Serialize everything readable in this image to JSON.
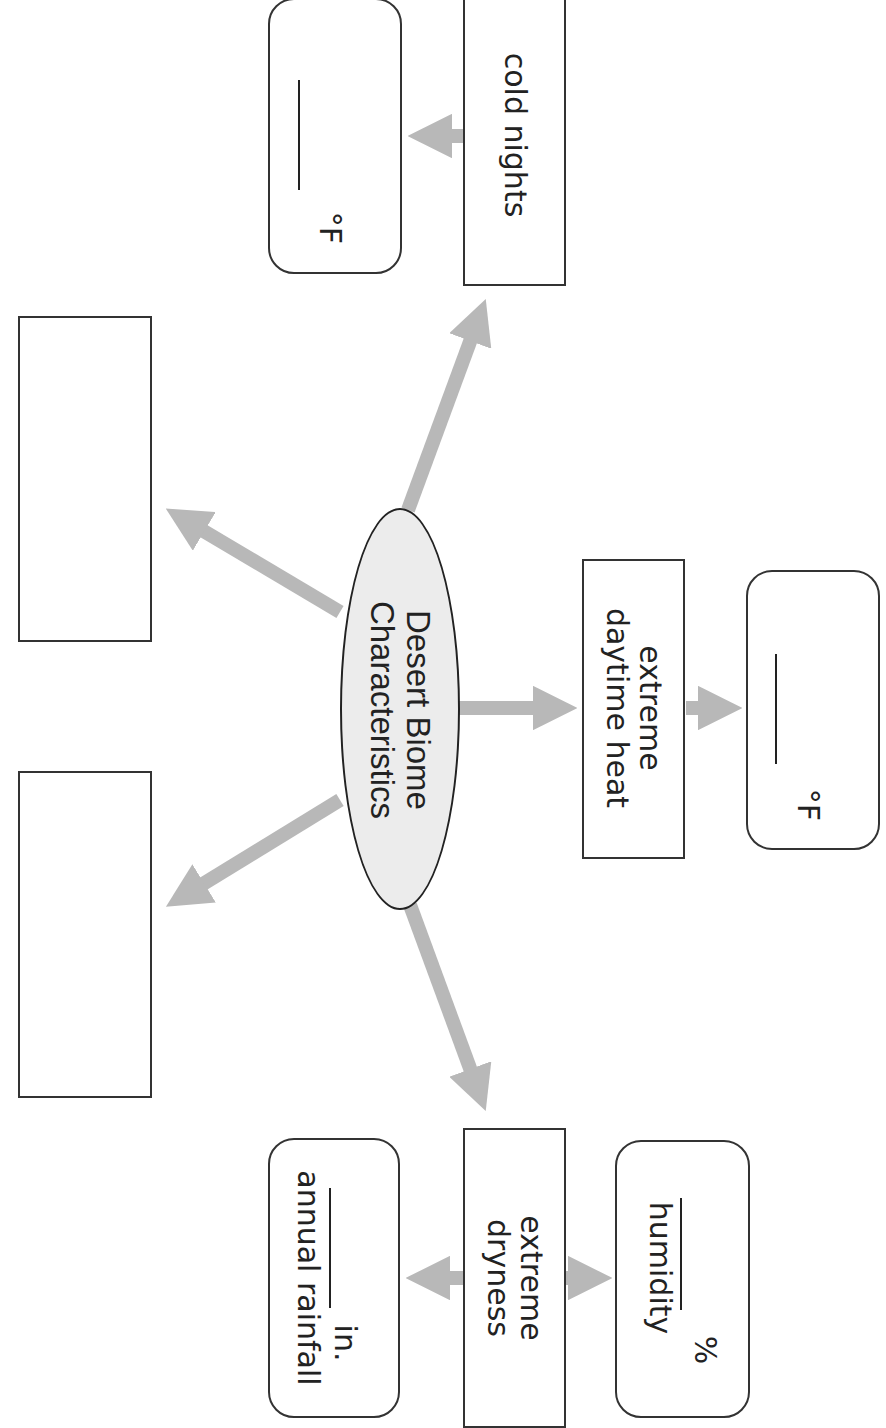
{
  "diagram": {
    "title_line1": "Desert Biome",
    "title_line2": "Characteristics",
    "branches": {
      "cold_nights": {
        "label": "cold nights",
        "answer_unit": "°F"
      },
      "daytime_heat": {
        "label_line1": "extreme",
        "label_line2": "daytime heat",
        "answer_unit": "°F"
      },
      "dryness": {
        "label_line1": "extreme",
        "label_line2": "dryness",
        "rainfall": {
          "unit": "in.",
          "caption": "annual rainfall"
        },
        "humidity": {
          "unit": "%",
          "caption": "humidity"
        }
      },
      "blank_top": {
        "label": ""
      },
      "blank_bottom": {
        "label": ""
      }
    },
    "colors": {
      "arrow": "#b8b8b8",
      "ellipse_fill": "#ececec",
      "border": "#333333"
    }
  }
}
